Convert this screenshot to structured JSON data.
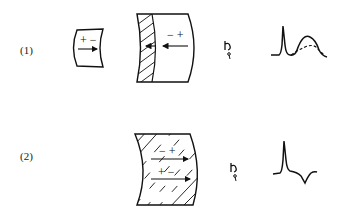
{
  "rows": [
    {
      "label": "(1)",
      "small_block": {
        "charges": "+ −",
        "arrow_direction": "right"
      },
      "large_block": {
        "charges": "− +",
        "arrow_direction": "left",
        "hatched_region": "left-strip"
      },
      "electrode": {
        "icon": "electrode-icon"
      },
      "ecg": {
        "description": "narrow spike followed by broad hump; dashed lower hump overlay",
        "has_dashed_overlay": true
      }
    },
    {
      "label": "(2)",
      "block": {
        "charges_top": "− +",
        "charges_bottom": "+ −",
        "arrow_direction": "right",
        "hatched_region": "full"
      },
      "electrode": {
        "icon": "electrode-icon"
      },
      "ecg": {
        "description": "narrow spike followed by negative inverted deflection",
        "has_dashed_overlay": false
      }
    }
  ],
  "colors": {
    "line": "#111111",
    "background": "#ffffff"
  }
}
